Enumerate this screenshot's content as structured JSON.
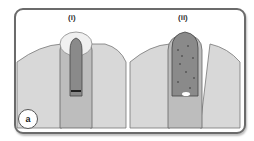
{
  "figure": {
    "panel_letter": "a",
    "panels": [
      {
        "label": "(i)"
      },
      {
        "label": "(ii)"
      }
    ],
    "colors": {
      "border": "#6b6b6b",
      "tissue_light": "#d8d8d8",
      "tissue_mid": "#bdbdbd",
      "cavity_dark": "#8a8a8a",
      "cap": "#f0f0f0"
    }
  }
}
